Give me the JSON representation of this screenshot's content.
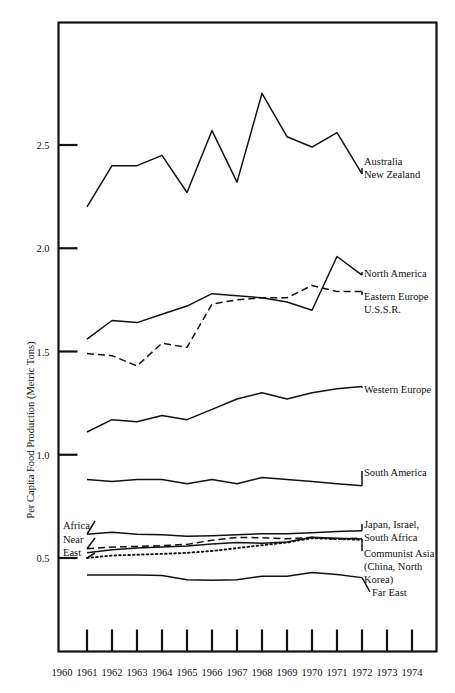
{
  "chart_data": {
    "type": "line",
    "title": "",
    "xlabel": "",
    "ylabel": "Per Capita Food Production (Metric Tons)",
    "xlim": [
      1960,
      1974
    ],
    "ylim": [
      0.25,
      2.85
    ],
    "yticks": [
      0.5,
      1.0,
      1.5,
      2.0,
      2.5
    ],
    "ytick_labels": [
      "0.5",
      "1.0",
      "1.5",
      "2.0",
      "2.5"
    ],
    "xticks": [
      1960,
      1961,
      1962,
      1963,
      1964,
      1965,
      1966,
      1967,
      1968,
      1969,
      1970,
      1971,
      1972,
      1973,
      1974
    ],
    "xtick_labels": [
      "1960",
      "1961",
      "1962",
      "1963",
      "1964",
      "1965",
      "1966",
      "1967",
      "1968",
      "1969",
      "1970",
      "1971",
      "1972",
      "1973",
      "1974"
    ],
    "grid": false,
    "legend": "right-inline-labels",
    "x": [
      1961,
      1962,
      1963,
      1964,
      1965,
      1966,
      1967,
      1968,
      1969,
      1970,
      1971,
      1972
    ],
    "series": [
      {
        "name": "Australia New Zealand",
        "label": "Australia\nNew Zealand",
        "label_line1": "Australia",
        "label_line2": "New Zealand",
        "style": "solid",
        "values": [
          2.2,
          2.4,
          2.4,
          2.45,
          2.27,
          2.57,
          2.32,
          2.75,
          2.54,
          2.49,
          2.56,
          2.36
        ]
      },
      {
        "name": "North America",
        "label": "North America",
        "label_line1": "North America",
        "label_line2": "",
        "style": "solid",
        "values": [
          1.56,
          1.65,
          1.64,
          1.68,
          1.72,
          1.78,
          1.77,
          1.76,
          1.74,
          1.7,
          1.96,
          1.87
        ]
      },
      {
        "name": "Eastern Europe U.S.S.R.",
        "label": "Eastern Europe\nU.S.S.R.",
        "label_line1": "Eastern Europe",
        "label_line2": "U.S.S.R.",
        "style": "dashed",
        "values": [
          1.49,
          1.48,
          1.43,
          1.54,
          1.52,
          1.73,
          1.75,
          1.76,
          1.76,
          1.82,
          1.79,
          1.79
        ]
      },
      {
        "name": "Western Europe",
        "label": "Western Europe",
        "label_line1": "Western Europe",
        "label_line2": "",
        "style": "solid",
        "values": [
          1.11,
          1.17,
          1.16,
          1.19,
          1.17,
          1.22,
          1.27,
          1.3,
          1.27,
          1.3,
          1.32,
          1.33
        ]
      },
      {
        "name": "South America",
        "label": "South America",
        "label_line1": "South America",
        "label_line2": "",
        "style": "solid",
        "values": [
          0.88,
          0.87,
          0.88,
          0.88,
          0.86,
          0.88,
          0.86,
          0.89,
          0.88,
          0.87,
          0.86,
          0.85
        ]
      },
      {
        "name": "Africa / Japan, Israel, South Africa",
        "label_left": "Africa",
        "label_line1": "Japan, Israel,",
        "label_line2": "South Africa",
        "style": "solid",
        "values": [
          0.615,
          0.625,
          0.615,
          0.613,
          0.605,
          0.608,
          0.612,
          0.618,
          0.618,
          0.622,
          0.628,
          0.632
        ]
      },
      {
        "name": "Near East",
        "label_left": "Near East",
        "label_left_line1": "Near",
        "label_left_line2": "East",
        "style": "dashed",
        "values": [
          0.545,
          0.553,
          0.556,
          0.56,
          0.566,
          0.586,
          0.6,
          0.598,
          0.593,
          0.6,
          0.592,
          0.596
        ]
      },
      {
        "name": "Communist Asia (China, North Korea)",
        "label_line1": "Communist Asia",
        "label_line2": "(China, North",
        "label_line3": "Korea)",
        "style": "solid",
        "values": [
          0.525,
          0.54,
          0.548,
          0.553,
          0.558,
          0.568,
          0.575,
          0.572,
          0.578,
          0.6,
          0.596,
          0.592
        ]
      },
      {
        "name": "Communist Asia dotted",
        "label": "",
        "style": "dotted",
        "values": [
          0.5,
          0.512,
          0.516,
          0.52,
          0.525,
          0.534,
          0.548,
          0.562,
          0.575,
          0.596,
          0.592,
          0.588
        ]
      },
      {
        "name": "Far East",
        "label_line1": "Far East",
        "label_line2": "",
        "style": "solid",
        "values": [
          0.418,
          0.418,
          0.418,
          0.415,
          0.395,
          0.392,
          0.395,
          0.412,
          0.412,
          0.43,
          0.42,
          0.405
        ]
      }
    ]
  },
  "axis": {
    "ylabel": "Per Capita Food Production (Metric Tons)"
  },
  "labels": {
    "australia": {
      "l1": "Australia",
      "l2": "New Zealand"
    },
    "north_america": {
      "l1": "North America"
    },
    "eastern_europe": {
      "l1": "Eastern Europe",
      "l2": "U.S.S.R."
    },
    "western_europe": {
      "l1": "Western Europe"
    },
    "south_america": {
      "l1": "South America"
    },
    "japan": {
      "l1": "Japan, Israel,",
      "l2": "South Africa"
    },
    "communist_asia": {
      "l1": "Communist Asia",
      "l2": "(China, North",
      "l3": "Korea)"
    },
    "far_east": {
      "l1": "Far East"
    },
    "africa": {
      "l1": "Africa"
    },
    "near_east": {
      "l1": "Near",
      "l2": "East"
    }
  }
}
